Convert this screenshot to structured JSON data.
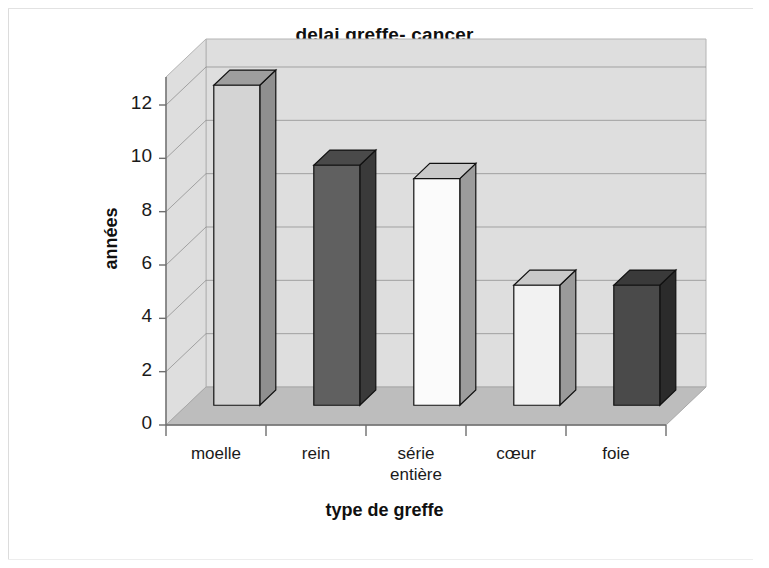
{
  "chart_data": {
    "type": "bar",
    "title": "delai greffe- cancer",
    "xlabel": "type de greffe",
    "ylabel": "années",
    "categories": [
      "moelle",
      "rein",
      "série entière",
      "cœur",
      "foie"
    ],
    "category_lines": [
      [
        "moelle"
      ],
      [
        "rein"
      ],
      [
        "série",
        "entière"
      ],
      [
        "cœur"
      ],
      [
        "foie"
      ]
    ],
    "values": [
      12,
      9,
      8.5,
      4.5,
      4.5
    ],
    "ylim": [
      0,
      12
    ],
    "ytick_values": [
      0,
      2,
      4,
      6,
      8,
      10,
      12
    ],
    "ytick_labels": [
      "0",
      "2",
      "4",
      "6",
      "8",
      "10",
      "12"
    ],
    "grid": true,
    "legend": "none",
    "style": "3d-column",
    "bar_colors": [
      "#d4d4d4",
      "#606060",
      "#fbfbfb",
      "#f2f2f2",
      "#4a4a4a"
    ],
    "bar_side_colors": [
      "#8f8f8f",
      "#3a3a3a",
      "#9c9c9c",
      "#9a9a9a",
      "#2b2b2b"
    ],
    "bar_top_colors": [
      "#9e9e9e",
      "#4a4a4a",
      "#c9c9c9",
      "#c9c9c9",
      "#3a3a3a"
    ],
    "wall_color": "#dedede",
    "floor_color": "#bdbdbd",
    "gridline_color": "#8d8d8d",
    "axis_color": "#6e6e6e"
  },
  "figure": {
    "background": "#ffffff",
    "border_color": "#dcdcdc"
  }
}
